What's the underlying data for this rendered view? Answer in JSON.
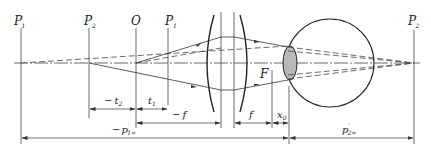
{
  "diagram": {
    "colors": {
      "line": "#333333",
      "lens_fill": "#b8b8b8",
      "background": "#ffffff"
    },
    "points": {
      "P1prime": {
        "base": "P",
        "prime": "′",
        "sub": "1"
      },
      "P2": {
        "base": "P",
        "sub": "2"
      },
      "O": {
        "base": "O"
      },
      "P1": {
        "base": "P",
        "sub": "1"
      },
      "Fprime": {
        "base": "F",
        "prime": "′"
      },
      "P2prime": {
        "base": "P",
        "prime": "′",
        "sub": "2"
      }
    },
    "dimensions": {
      "neg_t2": {
        "sign": "−",
        "base": "t",
        "sub": "2"
      },
      "t1": {
        "base": "t",
        "sub": "1"
      },
      "neg_f": {
        "sign": "−",
        "base": "f"
      },
      "fprime": {
        "base": "f",
        "prime": "′"
      },
      "x0": {
        "base": "x",
        "sub": "0"
      },
      "neg_p1inf": {
        "sign": "−",
        "base": "p",
        "prime": "′",
        "sub": "1∞"
      },
      "p2inf": {
        "base": "p",
        "prime": "′",
        "sub": "2∞"
      }
    }
  }
}
